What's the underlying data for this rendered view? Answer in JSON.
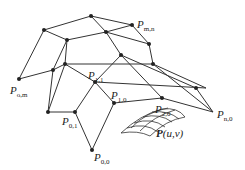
{
  "diagram": {
    "type": "bezier-control-net",
    "colors": {
      "line": "#333333",
      "point": "#222222",
      "text": "#222222"
    },
    "labels": [
      {
        "id": "P_mn",
        "base": "P",
        "sub": "m,n",
        "x": 137,
        "y": 28
      },
      {
        "id": "P_om",
        "base": "P",
        "sub": "o,m",
        "x": 10,
        "y": 94
      },
      {
        "id": "P_11",
        "base": "P",
        "sub": "1,1",
        "x": 88,
        "y": 79
      },
      {
        "id": "P_10",
        "base": "P",
        "sub": "1,0",
        "x": 111,
        "y": 99
      },
      {
        "id": "P_01",
        "base": "P",
        "sub": "0,1",
        "x": 62,
        "y": 125
      },
      {
        "id": "P_20",
        "base": "P",
        "sub": "2,0",
        "x": 155,
        "y": 113
      },
      {
        "id": "P_n0",
        "base": "P",
        "sub": "n,0",
        "x": 217,
        "y": 118
      },
      {
        "id": "P_00",
        "base": "P",
        "sub": "0,0",
        "x": 94,
        "y": 161
      }
    ],
    "surface_label": {
      "text": "P",
      "args": "(u,v)",
      "x": 156,
      "y": 137
    }
  }
}
